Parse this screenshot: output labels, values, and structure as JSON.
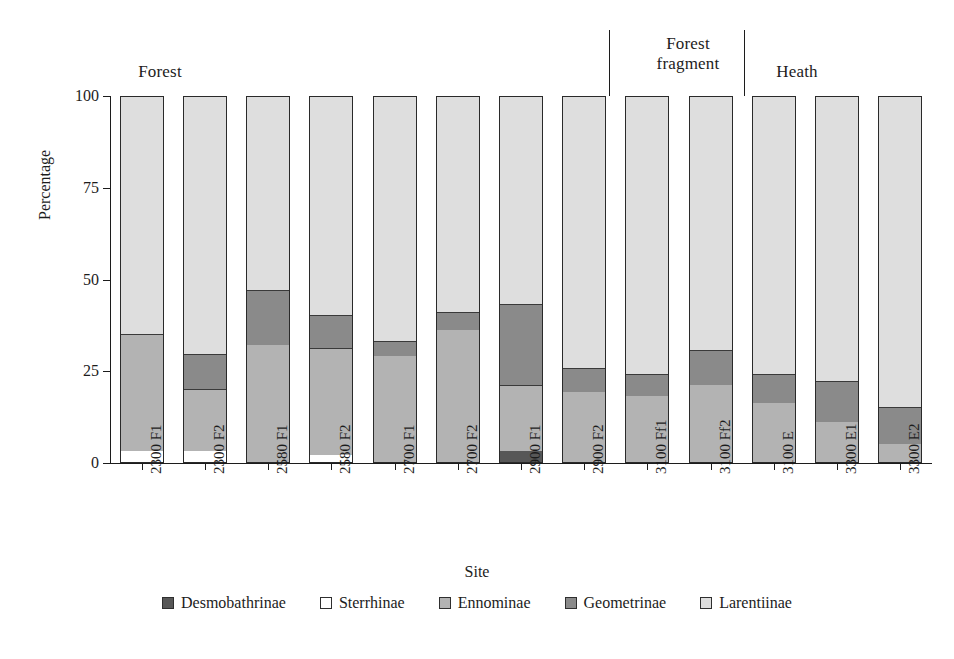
{
  "chart_data": {
    "type": "bar",
    "subtype": "stacked-100-percent",
    "title": "",
    "xlabel": "Site",
    "ylabel": "Percentage",
    "ylim": [
      0,
      100
    ],
    "yticks": [
      0,
      25,
      50,
      75,
      100
    ],
    "ytick_labels": [
      "0",
      "25",
      "50",
      "75",
      "100"
    ],
    "grid": false,
    "legend_position": "bottom",
    "categories": [
      "2300 F1",
      "2300 F2",
      "2580 F1",
      "2580 F2",
      "2700 F1",
      "2700 F2",
      "2900 F1",
      "2900 F2",
      "3100 Ff1",
      "3100 Ff2",
      "3100 E",
      "3300 E1",
      "3300 E2"
    ],
    "series": [
      {
        "name": "Desmobathrinae",
        "color": "#575757",
        "values": [
          0,
          0,
          0,
          0,
          0,
          0,
          3,
          0,
          0,
          0,
          0,
          0,
          0
        ]
      },
      {
        "name": "Sterrhinae",
        "color": "#ffffff",
        "values": [
          3,
          3,
          0,
          2,
          0,
          0,
          0,
          0,
          0,
          0,
          0,
          0,
          0
        ]
      },
      {
        "name": "Ennominae",
        "color": "#b3b3b3",
        "values": [
          32,
          17,
          32,
          29,
          29,
          36,
          18,
          19,
          18,
          21,
          16,
          11,
          5
        ]
      },
      {
        "name": "Geometrinae",
        "color": "#8a8a8a",
        "values": [
          0,
          9.5,
          15,
          9,
          4,
          5,
          22,
          6.5,
          6,
          9.5,
          8,
          11,
          10
        ]
      },
      {
        "name": "Larentiinae",
        "color": "#dedede",
        "values": [
          65,
          70.5,
          53,
          60,
          67,
          59,
          57,
          74.5,
          76,
          69.5,
          76,
          78,
          85
        ]
      }
    ],
    "groups": [
      {
        "label": "Forest",
        "start_index": 0,
        "end_index": 7
      },
      {
        "label": "Forest\nfragment",
        "label_line1": "Forest",
        "label_line2": "fragment",
        "start_index": 8,
        "end_index": 9
      },
      {
        "label": "Heath",
        "start_index": 10,
        "end_index": 12
      }
    ]
  },
  "axes": {
    "y_title": "Percentage",
    "x_title": "Site",
    "ytick_0": "0",
    "ytick_25": "25",
    "ytick_50": "50",
    "ytick_75": "75",
    "ytick_100": "100"
  },
  "groups": {
    "forest": "Forest",
    "fragment_line1": "Forest",
    "fragment_line2": "fragment",
    "heath": "Heath"
  },
  "legend": {
    "items": [
      {
        "label": "Desmobathrinae",
        "color": "#575757"
      },
      {
        "label": "Sterrhinae",
        "color": "#ffffff"
      },
      {
        "label": "Ennominae",
        "color": "#b3b3b3"
      },
      {
        "label": "Geometrinae",
        "color": "#8a8a8a"
      },
      {
        "label": "Larentiinae",
        "color": "#dedede"
      }
    ]
  },
  "xlabels": [
    "2300 F1",
    "2300 F2",
    "2580 F1",
    "2580 F2",
    "2700 F1",
    "2700 F2",
    "2900 F1",
    "2900 F2",
    "3100 Ff1",
    "3100 Ff2",
    "3100 E",
    "3300 E1",
    "3300 E2"
  ]
}
